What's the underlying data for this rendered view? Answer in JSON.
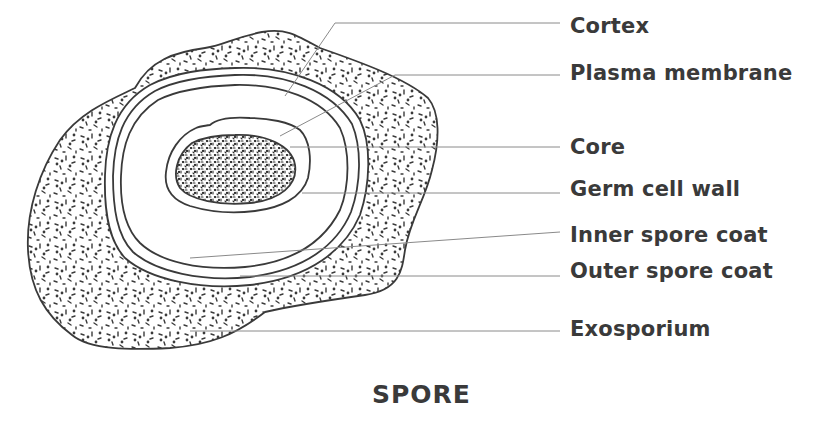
{
  "diagram": {
    "title": "SPORE",
    "colors": {
      "outline": "#3a3a3a",
      "leader": "#8a8a8a",
      "text": "#3a3a3a",
      "background": "#ffffff"
    },
    "labels": [
      {
        "id": "cortex",
        "text": "Cortex",
        "label_y": 27,
        "line": [
          [
            285,
            96
          ],
          [
            335,
            23
          ],
          [
            560,
            23
          ]
        ]
      },
      {
        "id": "plasma-membrane",
        "text": "Plasma membrane",
        "label_y": 74,
        "line": [
          [
            280,
            136
          ],
          [
            395,
            75
          ],
          [
            560,
            75
          ]
        ]
      },
      {
        "id": "core",
        "text": "Core",
        "label_y": 148,
        "line": [
          [
            290,
            147
          ],
          [
            560,
            147
          ]
        ]
      },
      {
        "id": "germ-cell-wall",
        "text": "Germ cell wall",
        "label_y": 190,
        "line": [
          [
            302,
            193
          ],
          [
            560,
            193
          ]
        ]
      },
      {
        "id": "inner-spore-coat",
        "text": "Inner spore coat",
        "label_y": 236,
        "line": [
          [
            190,
            258
          ],
          [
            560,
            232
          ]
        ]
      },
      {
        "id": "outer-spore-coat",
        "text": "Outer spore coat",
        "label_y": 272,
        "line": [
          [
            240,
            276
          ],
          [
            560,
            276
          ]
        ]
      },
      {
        "id": "exosporium",
        "text": "Exosporium",
        "label_y": 330,
        "line": [
          [
            190,
            331
          ],
          [
            560,
            331
          ]
        ]
      }
    ]
  }
}
